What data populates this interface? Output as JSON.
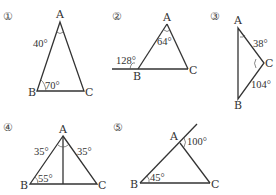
{
  "figures": [
    {
      "id": "1",
      "number_label": "①",
      "vertices": {
        "A": "A",
        "B": "B",
        "C": "C"
      },
      "angles": [
        {
          "at": "A",
          "label": "40°"
        },
        {
          "at": "B",
          "label": "70°"
        }
      ]
    },
    {
      "id": "2",
      "number_label": "②",
      "vertices": {
        "A": "A",
        "B": "B",
        "C": "C"
      },
      "angles": [
        {
          "at": "B-exterior",
          "label": "128°"
        },
        {
          "at": "A",
          "label": "64°"
        }
      ]
    },
    {
      "id": "3",
      "number_label": "③",
      "vertices": {
        "A": "A",
        "B": "B",
        "C": "C"
      },
      "angles": [
        {
          "at": "A",
          "label": "38°"
        },
        {
          "at": "C",
          "label": "104°"
        }
      ]
    },
    {
      "id": "4",
      "number_label": "④",
      "vertices": {
        "A": "A",
        "B": "B",
        "C": "C"
      },
      "angles": [
        {
          "at": "A-left",
          "label": "35°"
        },
        {
          "at": "A-right",
          "label": "35°"
        },
        {
          "at": "B",
          "label": "55°"
        }
      ]
    },
    {
      "id": "5",
      "number_label": "⑤",
      "vertices": {
        "A": "A",
        "B": "B",
        "C": "C"
      },
      "angles": [
        {
          "at": "A-exterior",
          "label": "100°"
        },
        {
          "at": "B",
          "label": "45°"
        }
      ]
    }
  ]
}
